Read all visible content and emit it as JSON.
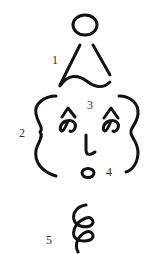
{
  "figure": {
    "labels": [
      {
        "id": "1",
        "text": "1",
        "x": 52,
        "y": 54
      },
      {
        "id": "2",
        "text": "2",
        "x": 19,
        "y": 127
      },
      {
        "id": "3",
        "text": "3",
        "x": 87,
        "y": 99
      },
      {
        "id": "4",
        "text": "4",
        "x": 106,
        "y": 166
      },
      {
        "id": "5",
        "text": "5",
        "x": 46,
        "y": 234
      }
    ],
    "parts": {
      "hat": {
        "name": "hat",
        "head_circle": true,
        "shape": "triangle-with-wave"
      },
      "face_outline": {
        "name": "face-braces",
        "left": "{",
        "right": "}"
      },
      "eyes": {
        "caret": "^",
        "kana": "の"
      },
      "nose": {
        "kana": "し"
      },
      "mouth": {
        "shape": "oval"
      },
      "body": {
        "shape": "spiral"
      }
    },
    "colors": {
      "ink": "#111111",
      "label": "#333333",
      "background": "#ffffff"
    }
  }
}
